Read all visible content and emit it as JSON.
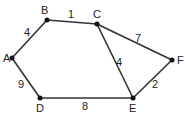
{
  "graph": {
    "nodes": [
      "A",
      "B",
      "C",
      "D",
      "E",
      "F"
    ],
    "edges": [
      {
        "from": "A",
        "to": "B",
        "weight": "4"
      },
      {
        "from": "B",
        "to": "C",
        "weight": "1"
      },
      {
        "from": "C",
        "to": "F",
        "weight": "7"
      },
      {
        "from": "C",
        "to": "E",
        "weight": "4"
      },
      {
        "from": "E",
        "to": "F",
        "weight": "2"
      },
      {
        "from": "D",
        "to": "E",
        "weight": "8"
      },
      {
        "from": "A",
        "to": "D",
        "weight": "9"
      }
    ]
  }
}
